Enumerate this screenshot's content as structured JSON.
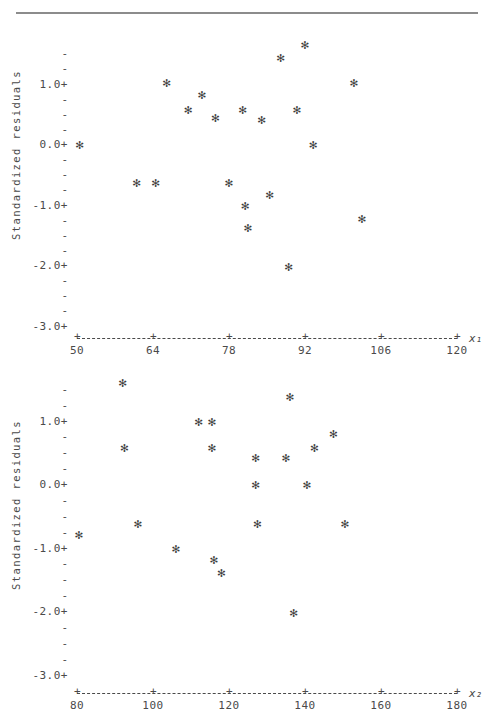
{
  "figure": {
    "divider_rule": true,
    "marker_glyph": "✻",
    "axis_color": "#4a4a4a"
  },
  "chart_data": [
    {
      "id": "residuals-vs-x1",
      "type": "scatter",
      "title": "",
      "xlabel": "x₁",
      "ylabel": "Standardized residuals",
      "xlim": [
        50,
        120
      ],
      "ylim": [
        -3.0,
        1.6
      ],
      "xticks": [
        50,
        64,
        78,
        92,
        106,
        120
      ],
      "xtick_labels": [
        "50",
        "64",
        "78",
        "92",
        "106",
        "120"
      ],
      "yticks": [
        1.0,
        0.0,
        -1.0,
        -2.0,
        -3.0
      ],
      "ytick_labels": [
        "1.0+",
        "0.0+",
        "-1.0+",
        "-2.0+",
        "-3.0+"
      ],
      "y_minor_count_between": 3,
      "grid": false,
      "legend": "none",
      "points": [
        {
          "x": 50.5,
          "y": 0.0
        },
        {
          "x": 61.0,
          "y": -0.62
        },
        {
          "x": 64.5,
          "y": -0.62
        },
        {
          "x": 66.5,
          "y": 1.03
        },
        {
          "x": 70.5,
          "y": 0.58
        },
        {
          "x": 73.0,
          "y": 0.83
        },
        {
          "x": 75.5,
          "y": 0.45
        },
        {
          "x": 78.0,
          "y": -0.62
        },
        {
          "x": 80.5,
          "y": 0.58
        },
        {
          "x": 81.0,
          "y": -1.0
        },
        {
          "x": 81.5,
          "y": -1.38
        },
        {
          "x": 84.0,
          "y": 0.42
        },
        {
          "x": 85.5,
          "y": -0.82
        },
        {
          "x": 87.5,
          "y": 1.43
        },
        {
          "x": 89.0,
          "y": -2.02
        },
        {
          "x": 90.5,
          "y": 0.58
        },
        {
          "x": 92.0,
          "y": 1.65
        },
        {
          "x": 93.5,
          "y": 0.0
        },
        {
          "x": 101.0,
          "y": 1.03
        },
        {
          "x": 102.5,
          "y": -1.22
        }
      ]
    },
    {
      "id": "residuals-vs-x2",
      "type": "scatter",
      "title": "",
      "xlabel": "x₂",
      "ylabel": "Standardized residuals",
      "xlim": [
        80,
        180
      ],
      "ylim": [
        -3.0,
        1.6
      ],
      "xticks": [
        80,
        100,
        120,
        140,
        160,
        180
      ],
      "xtick_labels": [
        "80",
        "100",
        "120",
        "140",
        "160",
        "180"
      ],
      "yticks": [
        1.0,
        0.0,
        -1.0,
        -2.0,
        -3.0
      ],
      "ytick_labels": [
        "1.0+",
        "0.0+",
        "-1.0+",
        "-2.0+",
        "-3.0+"
      ],
      "y_minor_count_between": 3,
      "grid": false,
      "legend": "none",
      "points": [
        {
          "x": 80.5,
          "y": -0.78
        },
        {
          "x": 92.0,
          "y": 1.6
        },
        {
          "x": 92.5,
          "y": 0.58
        },
        {
          "x": 96.0,
          "y": -0.62
        },
        {
          "x": 106.0,
          "y": -1.0
        },
        {
          "x": 112.0,
          "y": 1.0
        },
        {
          "x": 115.5,
          "y": 1.0
        },
        {
          "x": 115.5,
          "y": 0.58
        },
        {
          "x": 116.0,
          "y": -1.18
        },
        {
          "x": 118.0,
          "y": -1.38
        },
        {
          "x": 127.0,
          "y": 0.42
        },
        {
          "x": 127.0,
          "y": 0.0
        },
        {
          "x": 127.5,
          "y": -0.62
        },
        {
          "x": 135.0,
          "y": 0.42
        },
        {
          "x": 136.0,
          "y": 1.38
        },
        {
          "x": 137.0,
          "y": -2.02
        },
        {
          "x": 140.5,
          "y": 0.0
        },
        {
          "x": 142.5,
          "y": 0.58
        },
        {
          "x": 147.5,
          "y": 0.8
        },
        {
          "x": 150.5,
          "y": -0.62
        }
      ]
    }
  ]
}
